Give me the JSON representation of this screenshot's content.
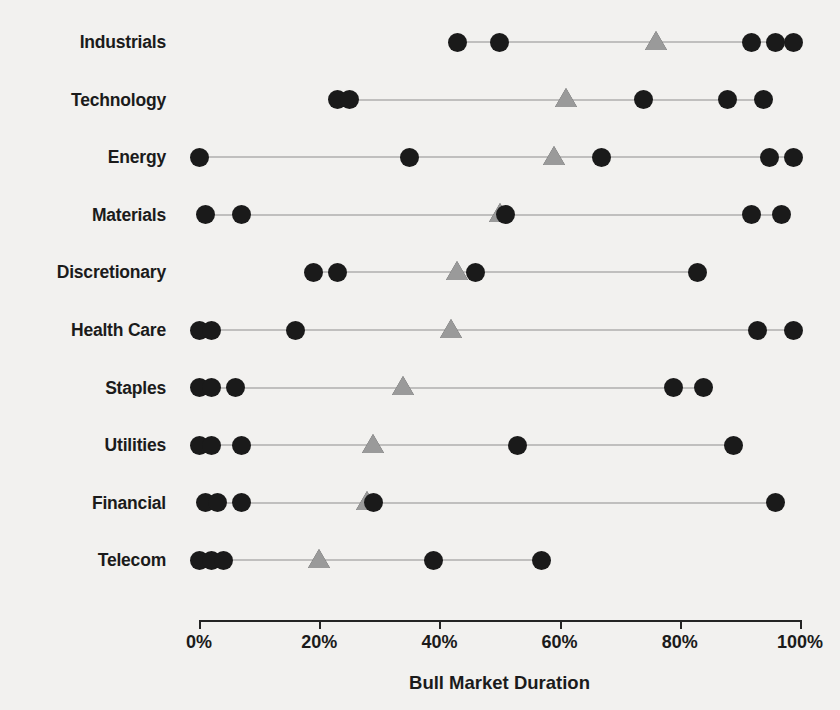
{
  "chart_data": {
    "type": "scatter",
    "title": "",
    "xlabel": "Bull Market Duration",
    "ylabel": "",
    "xlim": [
      0,
      100
    ],
    "xticks": [
      0,
      20,
      40,
      60,
      80,
      100
    ],
    "xticklabels": [
      "0%",
      "20%",
      "40%",
      "60%",
      "80%",
      "100%"
    ],
    "grid": false,
    "legend": null,
    "categories": [
      "Industrials",
      "Technology",
      "Energy",
      "Materials",
      "Discretionary",
      "Health Care",
      "Staples",
      "Utilities",
      "Financial",
      "Telecom"
    ],
    "series": [
      {
        "name": "Observations",
        "marker": "circle",
        "color": "#1a1a1a",
        "values_by_category": {
          "Industrials": [
            43,
            50,
            92,
            96,
            99
          ],
          "Technology": [
            23,
            25,
            74,
            88,
            94
          ],
          "Energy": [
            0,
            35,
            67,
            95,
            99
          ],
          "Materials": [
            1,
            7,
            51,
            92,
            97
          ],
          "Discretionary": [
            19,
            23,
            46,
            83
          ],
          "Health Care": [
            0,
            2,
            16,
            93,
            99
          ],
          "Staples": [
            0,
            2,
            6,
            79,
            84
          ],
          "Utilities": [
            0,
            2,
            7,
            53,
            89
          ],
          "Financial": [
            1,
            3,
            7,
            29,
            96
          ],
          "Telecom": [
            0,
            2,
            4,
            39,
            57
          ]
        }
      },
      {
        "name": "Median",
        "marker": "triangle",
        "color": "#9a9a9a",
        "values_by_category": {
          "Industrials": [
            76
          ],
          "Technology": [
            61
          ],
          "Energy": [
            59
          ],
          "Materials": [
            50
          ],
          "Discretionary": [
            43
          ],
          "Health Care": [
            42
          ],
          "Staples": [
            34
          ],
          "Utilities": [
            29
          ],
          "Financial": [
            28
          ],
          "Telecom": [
            20
          ]
        }
      }
    ]
  },
  "axis": {
    "x_title": "Bull Market Duration"
  }
}
